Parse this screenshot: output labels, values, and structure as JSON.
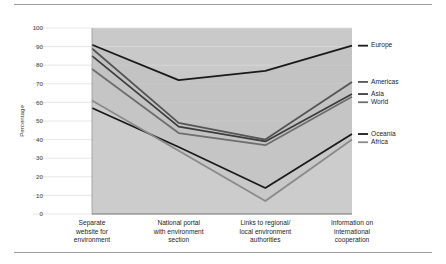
{
  "figure": {
    "has_top_rule": true,
    "has_bottom_rule": true
  },
  "chart_data": {
    "type": "line",
    "title": "",
    "subtitle": "",
    "xlabel": "",
    "ylabel": "Percentage",
    "ylim": [
      0,
      100
    ],
    "yticks": [
      "0",
      "10",
      "20",
      "30",
      "40",
      "50",
      "60",
      "70",
      "80",
      "90",
      "100"
    ],
    "ytick_values": [
      0,
      10,
      20,
      30,
      40,
      50,
      60,
      70,
      80,
      90,
      100
    ],
    "grid": "horizontal",
    "legend_position": "right",
    "area_fill": true,
    "plot_bg": "#c9c9c9",
    "categories": [
      "Separate\nwebsite for\nenvironment",
      "National portal\nwith environment\nsection",
      "Links to regional/\nlocal environment\nauthorities",
      "Information on\ninternational\ncooperation"
    ],
    "category_lines": [
      [
        "Separate",
        "website for",
        "environment"
      ],
      [
        "National portal",
        "with environment",
        "section"
      ],
      [
        "Links to regional/",
        "local environment",
        "authorities"
      ],
      [
        "Information on",
        "international",
        "cooperation"
      ]
    ],
    "series": [
      {
        "name": "Europe",
        "values": [
          91,
          72,
          77,
          90.5
        ],
        "color": "#1a1a1a"
      },
      {
        "name": "Americas",
        "values": [
          89,
          49,
          40,
          71
        ],
        "color": "#555555"
      },
      {
        "name": "Asia",
        "values": [
          85,
          47,
          39,
          64.5
        ],
        "color": "#3d3d3d"
      },
      {
        "name": "World",
        "values": [
          78,
          43.5,
          37,
          63
        ],
        "color": "#6e6e6e"
      },
      {
        "name": "Oceania",
        "values": [
          57,
          36,
          14,
          43
        ],
        "color": "#1a1a1a"
      },
      {
        "name": "Africa",
        "values": [
          61,
          34,
          7,
          40
        ],
        "color": "#8a8a8a"
      }
    ],
    "legend_entries": [
      {
        "label": "Europe",
        "color": "#1a1a1a"
      },
      {
        "label": "Americas",
        "color": "#555555"
      },
      {
        "label": "Asia",
        "color": "#3d3d3d"
      },
      {
        "label": "World",
        "color": "#6e6e6e"
      },
      {
        "label": "Oceania",
        "color": "#1a1a1a"
      },
      {
        "label": "Africa",
        "color": "#8a8a8a"
      }
    ]
  }
}
